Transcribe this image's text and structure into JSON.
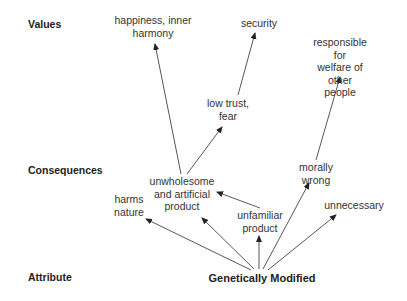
{
  "levels": {
    "values": "Values",
    "consequences": "Consequences",
    "attribute": "Attribute"
  },
  "nodes": {
    "happiness": "happiness, inner\nharmony",
    "security": "security",
    "responsible": "responsible for\nwelfare of other\npeople",
    "low_trust": "low trust,\nfear",
    "unwholesome": "unwholesome\nand artificial\nproduct",
    "harms_nature": "harms\nnature",
    "unfamiliar": "unfamiliar\nproduct",
    "morally_wrong": "morally\nwrong",
    "unnecessary": "unnecessary",
    "genetically_modified": "Genetically Modified"
  },
  "edges": [
    {
      "from": "genetically_modified",
      "to": "harms_nature"
    },
    {
      "from": "genetically_modified",
      "to": "unwholesome"
    },
    {
      "from": "genetically_modified",
      "to": "unfamiliar"
    },
    {
      "from": "genetically_modified",
      "to": "morally_wrong"
    },
    {
      "from": "genetically_modified",
      "to": "unnecessary"
    },
    {
      "from": "unfamiliar",
      "to": "unwholesome"
    },
    {
      "from": "unwholesome",
      "to": "happiness"
    },
    {
      "from": "unwholesome",
      "to": "low_trust"
    },
    {
      "from": "low_trust",
      "to": "security"
    },
    {
      "from": "morally_wrong",
      "to": "responsible"
    }
  ],
  "colors": {
    "line": "#333333",
    "text": "#333333",
    "background": "#ffffff"
  }
}
